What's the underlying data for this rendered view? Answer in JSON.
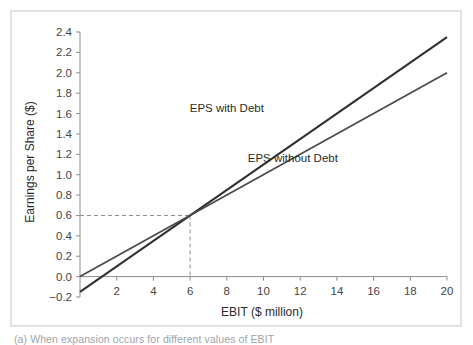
{
  "figure": {
    "frame_border_color": "#e2e2e4",
    "background_color": "#ffffff",
    "caption": "(a) When expansion occurs for different values of EBIT"
  },
  "chart_data": {
    "type": "line",
    "title": "",
    "xlabel": "EBIT ($ million)",
    "ylabel": "Earnings per Share ($)",
    "xlim": [
      0,
      20
    ],
    "ylim": [
      -0.2,
      2.4
    ],
    "xticks": [
      2,
      4,
      6,
      8,
      10,
      12,
      14,
      16,
      18,
      20
    ],
    "xtick_labels": [
      "2",
      "4",
      "6",
      "8",
      "10",
      "12",
      "14",
      "16",
      "18",
      "20"
    ],
    "yticks": [
      -0.2,
      0.0,
      0.2,
      0.4,
      0.6,
      0.8,
      1.0,
      1.2,
      1.4,
      1.6,
      1.8,
      2.0,
      2.2,
      2.4
    ],
    "ytick_labels": [
      "−0.2",
      "0.0",
      "0.2",
      "0.4",
      "0.6",
      "0.8",
      "1.0",
      "1.2",
      "1.4",
      "1.6",
      "1.8",
      "2.0",
      "2.2",
      "2.4"
    ],
    "grid": false,
    "legend_position": "inline-annotation",
    "series": [
      {
        "name": "EPS with Debt",
        "color": "#2f2f2f",
        "line_width": 2.0,
        "x": [
          0,
          20
        ],
        "values": [
          -0.15,
          2.35
        ],
        "label_text": "EPS with Debt",
        "label_x": 8.0,
        "label_y": 1.62
      },
      {
        "name": "EPS without Debt",
        "color": "#4a4a4a",
        "line_width": 1.7,
        "x": [
          0,
          20
        ],
        "values": [
          0.0,
          2.0
        ],
        "label_text": "EPS without Debt",
        "label_x": 11.6,
        "label_y": 1.12
      }
    ],
    "annotations": [
      {
        "name": "break-even-point",
        "x": 6,
        "y": 0.6,
        "style": "dashed-guide-lines"
      }
    ]
  }
}
